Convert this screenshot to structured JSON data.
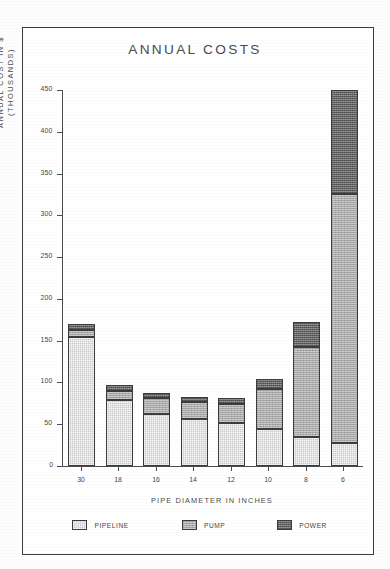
{
  "chart_data": {
    "type": "bar",
    "subtype": "stacked",
    "title": "ANNUAL COSTS",
    "xlabel": "PIPE DIAMETER IN INCHES",
    "ylabel": "ANNUAL COST IN $ (THOUSANDS)",
    "ylabel_line1": "ANNUAL COST IN $",
    "ylabel_line2": "(THOUSANDS)",
    "categories": [
      "30",
      "18",
      "16",
      "14",
      "12",
      "10",
      "8",
      "6"
    ],
    "yticks": [
      0,
      50,
      100,
      150,
      200,
      250,
      300,
      350,
      400,
      450
    ],
    "ylim": [
      0,
      450
    ],
    "grid": false,
    "legend_position": "bottom",
    "series": [
      {
        "name": "PIPELINE",
        "color": "#c9c9c9",
        "values": [
          155,
          79,
          62,
          56,
          52,
          44,
          35,
          27
        ]
      },
      {
        "name": "PUMP",
        "color": "#a9a9a9",
        "values": [
          8,
          11,
          20,
          21,
          22,
          48,
          107,
          298
        ]
      },
      {
        "name": "POWER",
        "color": "#7d7d7d",
        "values": [
          7,
          7,
          6,
          6,
          8,
          12,
          30,
          125
        ]
      }
    ],
    "totals": [
      170,
      97,
      88,
      83,
      82,
      104,
      172,
      450
    ]
  },
  "legend": {
    "items": [
      {
        "label": "PIPELINE",
        "swatch": "pipeline-swatch"
      },
      {
        "label": "PUMP",
        "swatch": "pump-swatch"
      },
      {
        "label": "POWER",
        "swatch": "power-swatch"
      }
    ]
  }
}
